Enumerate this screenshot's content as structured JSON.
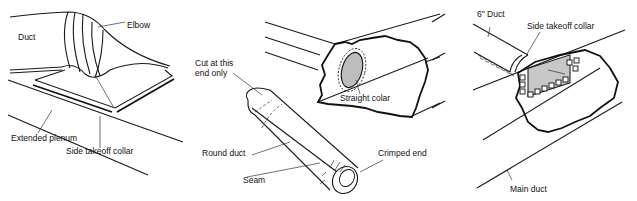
{
  "diagram": {
    "panels": [
      {
        "id": "elbow-plenum",
        "labels": {
          "duct": "Duct",
          "elbow": "Elbow",
          "plenum": "Extended plenum",
          "collar": "Side takeoff collar"
        }
      },
      {
        "id": "round-duct",
        "labels": {
          "cut": "Cut at this\nend only",
          "cut_line1": "Cut at this",
          "cut_line2": "end only",
          "straight_collar": "Straight colar",
          "round_duct": "Round duct",
          "seam": "Seam",
          "crimped_end": "Crimped end"
        }
      },
      {
        "id": "side-takeoff",
        "labels": {
          "six_inch_duct": "6\" Duct",
          "collar": "Side takeoff collar",
          "main_duct": "Main duct"
        }
      }
    ]
  }
}
